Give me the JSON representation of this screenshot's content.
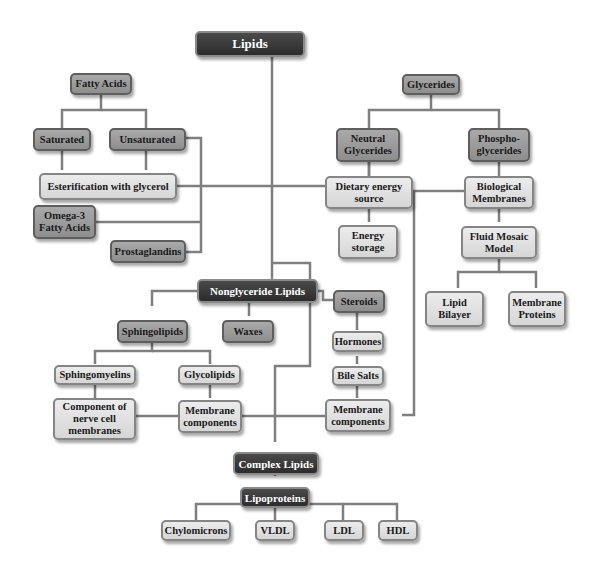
{
  "diagram": {
    "title": "Lipids",
    "nodes": {
      "lipids": "Lipids",
      "fatty_acids": "Fatty Acids",
      "saturated": "Saturated",
      "unsaturated": "Unsaturated",
      "esterification": "Esterification with glycerol",
      "omega3": "Omega-3 Fatty Acids",
      "prostaglandins": "Prostaglandins",
      "glycerides": "Glycerides",
      "neutral_glycerides": "Neutral Glycerides",
      "phosphoglycerides": "Phospho- glycerides",
      "dietary_energy": "Dietary energy source",
      "energy_storage": "Energy storage",
      "biological_membranes": "Biological Membranes",
      "fluid_mosaic": "Fluid Mosaic Model",
      "lipid_bilayer": "Lipid Bilayer",
      "membrane_proteins": "Membrane Proteins",
      "nonglyceride": "Nonglyceride Lipids",
      "sphingolipids": "Sphingolipids",
      "waxes": "Waxes",
      "steroids": "Steroids",
      "hormones": "Hormones",
      "bile_salts": "Bile Salts",
      "steroid_membrane_components": "Membrane components",
      "sphingomyelins": "Sphingomyelins",
      "glycolipids": "Glycolipids",
      "nerve_cell": "Component of nerve cell membranes",
      "glyco_membrane_components": "Membrane components",
      "complex_lipids": "Complex Lipids",
      "lipoproteins": "Lipoproteins",
      "chylomicrons": "Chylomicrons",
      "vldl": "VLDL",
      "ldl": "LDL",
      "hdl": "HDL"
    },
    "colors": {
      "dark": "#333333",
      "mid": "#9a9a9a",
      "light": "#e2e2e2",
      "line": "#7a7a7a"
    }
  }
}
